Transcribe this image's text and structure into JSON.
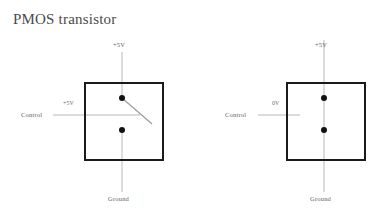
{
  "page": {
    "title": "PMOS transistor",
    "background_color": "#ffffff",
    "text_color": "#4a4a4a"
  },
  "colors": {
    "box_stroke": "#1a1a1a",
    "wire": "#b8b8b8",
    "switch_arm": "#9a9a9a",
    "node_dot": "#111111",
    "label_text": "#5f5f5f"
  },
  "diagrams": [
    {
      "id": "pmos-control-high",
      "state": "open",
      "top_terminal_label": "+5V",
      "bottom_terminal_label": "Ground",
      "control_label": "Control",
      "control_value_label": "+5V",
      "box": {
        "x": 85,
        "y": 83,
        "width": 78,
        "height": 77
      },
      "top_node": {
        "x": 122,
        "y": 98
      },
      "bottom_node": {
        "x": 122,
        "y": 130
      },
      "switch_arm_end": {
        "x": 152,
        "y": 124
      }
    },
    {
      "id": "pmos-control-low",
      "state": "closed",
      "top_terminal_label": "+5V",
      "bottom_terminal_label": "Ground",
      "control_label": "Control",
      "control_value_label": "0V",
      "box": {
        "x": 287,
        "y": 83,
        "width": 78,
        "height": 77
      },
      "top_node": {
        "x": 324,
        "y": 98
      },
      "bottom_node": {
        "x": 324,
        "y": 130
      },
      "switch_arm_end": null
    }
  ]
}
